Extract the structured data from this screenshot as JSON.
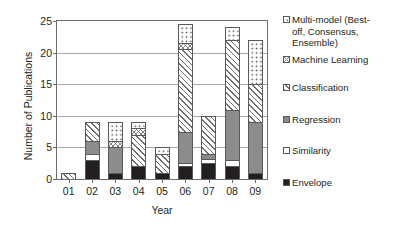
{
  "chart_data": {
    "type": "bar",
    "subtype": "stacked-bar",
    "title": "",
    "xlabel": "Year",
    "ylabel": "Number of Publications",
    "categories": [
      "01",
      "02",
      "03",
      "04",
      "05",
      "06",
      "07",
      "08",
      "09"
    ],
    "ylim": [
      0,
      25
    ],
    "yticks": [
      0,
      5,
      10,
      15,
      20,
      25
    ],
    "grid": "horizontal",
    "legend_position": "right",
    "series": [
      {
        "name": "Envelope",
        "pattern": "solid-black",
        "color": "#231f20",
        "values": [
          0,
          3,
          1,
          2,
          1,
          2,
          2.5,
          2,
          1
        ]
      },
      {
        "name": "Similarity",
        "pattern": "blank-white",
        "color": "#ffffff",
        "values": [
          0,
          1,
          0,
          0,
          0,
          0.5,
          0.7,
          1,
          0
        ]
      },
      {
        "name": "Regression",
        "pattern": "solid-gray",
        "color": "#8a8c8e",
        "values": [
          0,
          2,
          4,
          0,
          0,
          5,
          0.8,
          8,
          8
        ]
      },
      {
        "name": "Classification",
        "pattern": "diagonal-hatch",
        "color": "#6d6e71",
        "values": [
          1,
          3,
          0,
          5,
          3,
          13,
          6,
          11,
          6
        ]
      },
      {
        "name": "Machine Learning",
        "pattern": "checkerboard",
        "color": "#808285",
        "values": [
          0,
          0,
          1,
          1,
          0,
          1,
          0,
          0,
          0
        ]
      },
      {
        "name": "Multi-model (Best-off, Consensus, Ensemble)",
        "pattern": "dotted",
        "color": "#4d4d4f",
        "values": [
          0,
          0,
          3,
          1,
          1,
          3,
          0,
          2,
          7
        ]
      }
    ],
    "totals": [
      1,
      9,
      9,
      9,
      5,
      25,
      10,
      24,
      22
    ]
  },
  "legend": {
    "items": [
      {
        "label": "Multi-model (Best-\noff, Consensus,\nEnsemble)",
        "series": "Multi-model (Best-off, Consensus, Ensemble)"
      },
      {
        "label": "Machine Learning",
        "series": "Machine Learning"
      },
      {
        "label": "Classification",
        "series": "Classification"
      },
      {
        "label": "Regression",
        "series": "Regression"
      },
      {
        "label": "Similarity",
        "series": "Similarity"
      },
      {
        "label": "Envelope",
        "series": "Envelope"
      }
    ]
  }
}
